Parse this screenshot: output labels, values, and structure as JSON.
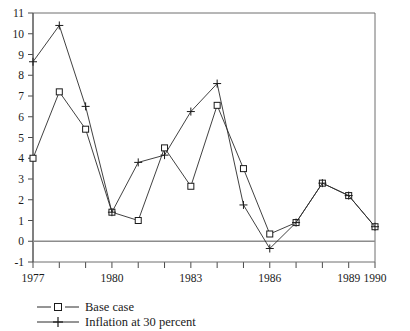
{
  "chart_data": {
    "type": "line",
    "title": "",
    "subtitle": "",
    "xlabel": "",
    "ylabel": "",
    "x": [
      1977,
      1978,
      1979,
      1980,
      1981,
      1982,
      1983,
      1984,
      1985,
      1986,
      1987,
      1988,
      1989,
      1990
    ],
    "xlim": [
      1977,
      1990
    ],
    "ylim": [
      -1,
      11
    ],
    "xticks": [
      1977,
      1978,
      1979,
      1980,
      1981,
      1982,
      1983,
      1984,
      1985,
      1986,
      1987,
      1988,
      1989,
      1990
    ],
    "xtick_labels": [
      "1977",
      "",
      "",
      "1980",
      "",
      "",
      "1983",
      "",
      "",
      "1986",
      "",
      "",
      "1989",
      "1990"
    ],
    "yticks": [
      -1,
      0,
      1,
      2,
      3,
      4,
      5,
      6,
      7,
      8,
      9,
      10,
      11
    ],
    "ytick_labels": [
      "-1",
      "0",
      "1",
      "2",
      "3",
      "4",
      "5",
      "6",
      "7",
      "8",
      "9",
      "10",
      "11"
    ],
    "grid": false,
    "zero_line": true,
    "legend_position": "below-left",
    "series": [
      {
        "name": "Base case",
        "marker": "square",
        "values": [
          4.0,
          7.2,
          5.4,
          1.4,
          1.0,
          4.5,
          2.65,
          6.55,
          3.5,
          0.35,
          0.9,
          2.8,
          2.2,
          0.7
        ]
      },
      {
        "name": "Inflation at 30 percent",
        "marker": "plus",
        "values": [
          8.65,
          10.4,
          6.5,
          1.4,
          3.8,
          4.15,
          6.25,
          7.6,
          1.75,
          -0.35,
          0.9,
          2.8,
          2.2,
          0.7
        ]
      }
    ]
  },
  "legend": {
    "items": [
      {
        "label": "Base case",
        "marker": "square-marker-icon"
      },
      {
        "label": "Inflation at 30 percent",
        "marker": "plus-marker-icon"
      }
    ]
  }
}
